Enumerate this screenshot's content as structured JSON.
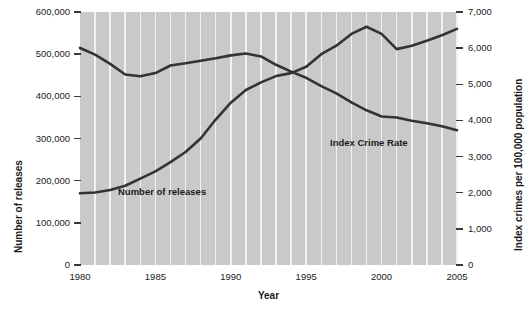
{
  "chart_data": {
    "type": "line",
    "title": "",
    "xlabel": "Year",
    "ylabel_left": "Number of releases",
    "ylabel_right": "Index crimes per 100,000 population",
    "grid": true,
    "legend_position": "inline-annotation",
    "x": [
      1980,
      1981,
      1982,
      1983,
      1984,
      1985,
      1986,
      1987,
      1988,
      1989,
      1990,
      1991,
      1992,
      1993,
      1994,
      1995,
      1996,
      1997,
      1998,
      1999,
      2000,
      2001,
      2002,
      2003,
      2004,
      2005
    ],
    "xlim": [
      1980,
      2005
    ],
    "xticks": [
      1980,
      1985,
      1990,
      1995,
      2000,
      2005
    ],
    "xtick_labels": [
      "1980",
      "1985",
      "1990",
      "1995",
      "2000",
      "2005"
    ],
    "ylim_left": [
      0,
      600000
    ],
    "yticks_left": [
      0,
      100000,
      200000,
      300000,
      400000,
      500000,
      600000
    ],
    "ytick_labels_left": [
      "0",
      "100,000",
      "200,000",
      "300,000",
      "400,000",
      "500,000",
      "600,000"
    ],
    "ylim_right": [
      0,
      7000
    ],
    "yticks_right": [
      0,
      1000,
      2000,
      3000,
      4000,
      5000,
      6000,
      7000
    ],
    "ytick_labels_right": [
      "0",
      "1,000",
      "2,000",
      "3,000",
      "4,000",
      "5,000",
      "6,000",
      "7,000"
    ],
    "series": [
      {
        "name": "Number of releases",
        "axis": "left",
        "annotation": "Number of releases",
        "values": [
          170000,
          172000,
          178000,
          188000,
          205000,
          222000,
          244000,
          268000,
          300000,
          345000,
          385000,
          415000,
          433000,
          448000,
          455000,
          470000,
          500000,
          520000,
          548000,
          565000,
          548000,
          512000,
          520000,
          532000,
          545000,
          560000
        ]
      },
      {
        "name": "Index Crime Rate",
        "axis": "right",
        "annotation": "Index Crime Rate",
        "values": [
          6005,
          5820,
          5565,
          5270,
          5220,
          5310,
          5520,
          5580,
          5650,
          5720,
          5800,
          5850,
          5770,
          5540,
          5350,
          5180,
          4950,
          4750,
          4500,
          4280,
          4110,
          4080,
          3990,
          3920,
          3840,
          3730
        ]
      }
    ],
    "colors": {
      "plot_background": "#c9c9c9",
      "gridline": "#f2f2f2",
      "line": "#333333",
      "text": "#1a1a1a"
    }
  }
}
